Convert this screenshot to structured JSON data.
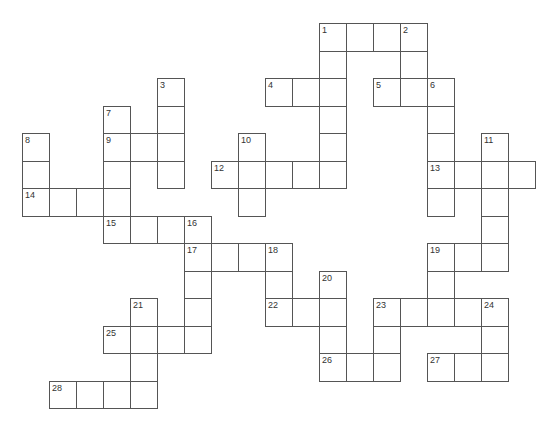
{
  "puzzle": {
    "type": "crossword",
    "grid": {
      "origin_x": 22,
      "origin_y": 23,
      "cell_w": 27,
      "cell_h": 27.5,
      "line_color": "#555555"
    },
    "entries": [
      {
        "num": "1",
        "dir": "across",
        "col": 11,
        "row": 0,
        "len": 4
      },
      {
        "num": "1",
        "dir": "down",
        "col": 11,
        "row": 0,
        "len": 6
      },
      {
        "num": "2",
        "dir": "down",
        "col": 14,
        "row": 0,
        "len": 3
      },
      {
        "num": "3",
        "dir": "down",
        "col": 5,
        "row": 2,
        "len": 4
      },
      {
        "num": "4",
        "dir": "across",
        "col": 9,
        "row": 2,
        "len": 3
      },
      {
        "num": "5",
        "dir": "across",
        "col": 13,
        "row": 2,
        "len": 3
      },
      {
        "num": "6",
        "dir": "down",
        "col": 15,
        "row": 2,
        "len": 5
      },
      {
        "num": "7",
        "dir": "down",
        "col": 3,
        "row": 3,
        "len": 5
      },
      {
        "num": "8",
        "dir": "down",
        "col": 0,
        "row": 4,
        "len": 3
      },
      {
        "num": "9",
        "dir": "across",
        "col": 3,
        "row": 4,
        "len": 3
      },
      {
        "num": "10",
        "dir": "down",
        "col": 8,
        "row": 4,
        "len": 3
      },
      {
        "num": "11",
        "dir": "down",
        "col": 17,
        "row": 4,
        "len": 5
      },
      {
        "num": "12",
        "dir": "across",
        "col": 7,
        "row": 5,
        "len": 5
      },
      {
        "num": "13",
        "dir": "across",
        "col": 15,
        "row": 5,
        "len": 4
      },
      {
        "num": "14",
        "dir": "across",
        "col": 0,
        "row": 6,
        "len": 4
      },
      {
        "num": "15",
        "dir": "across",
        "col": 3,
        "row": 7,
        "len": 4
      },
      {
        "num": "16",
        "dir": "down",
        "col": 6,
        "row": 7,
        "len": 5
      },
      {
        "num": "17",
        "dir": "across",
        "col": 6,
        "row": 8,
        "len": 4
      },
      {
        "num": "18",
        "dir": "down",
        "col": 9,
        "row": 8,
        "len": 3
      },
      {
        "num": "19",
        "dir": "across",
        "col": 15,
        "row": 8,
        "len": 3
      },
      {
        "num": "19",
        "dir": "down",
        "col": 15,
        "row": 8,
        "len": 3
      },
      {
        "num": "20",
        "dir": "down",
        "col": 11,
        "row": 9,
        "len": 4
      },
      {
        "num": "21",
        "dir": "down",
        "col": 4,
        "row": 10,
        "len": 4
      },
      {
        "num": "22",
        "dir": "across",
        "col": 9,
        "row": 10,
        "len": 3
      },
      {
        "num": "23",
        "dir": "across",
        "col": 13,
        "row": 10,
        "len": 5
      },
      {
        "num": "23",
        "dir": "down",
        "col": 13,
        "row": 10,
        "len": 3
      },
      {
        "num": "24",
        "dir": "down",
        "col": 17,
        "row": 10,
        "len": 3
      },
      {
        "num": "25",
        "dir": "across",
        "col": 3,
        "row": 11,
        "len": 4
      },
      {
        "num": "26",
        "dir": "across",
        "col": 11,
        "row": 12,
        "len": 3
      },
      {
        "num": "27",
        "dir": "across",
        "col": 15,
        "row": 12,
        "len": 3
      },
      {
        "num": "28",
        "dir": "across",
        "col": 1,
        "row": 13,
        "len": 4
      }
    ]
  }
}
